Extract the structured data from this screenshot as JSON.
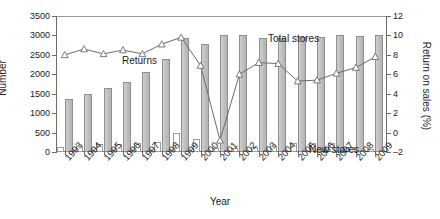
{
  "chart_data": {
    "type": "bar",
    "title": "",
    "xlabel": "Year",
    "ylabel": "Number",
    "ylabel_right": "Return on sales (%)",
    "categories": [
      "1993",
      "1994",
      "1995",
      "1996",
      "1997",
      "1998",
      "1999",
      "2000",
      "2001",
      "2002",
      "2003",
      "2004",
      "2005",
      "2006",
      "2007",
      "2008",
      "2009"
    ],
    "ylim": [
      0,
      3500
    ],
    "ylim_right": [
      -2,
      12
    ],
    "yticks": [
      0,
      500,
      1000,
      1500,
      2000,
      2500,
      3000,
      3500
    ],
    "yticks_right": [
      -2,
      0,
      2,
      4,
      6,
      8,
      10,
      12
    ],
    "grid": false,
    "legend_position": "in-plot annotations",
    "series": [
      {
        "name": "Total stores",
        "kind": "bar",
        "axis": "left",
        "color": "#c2c2c2",
        "values": [
          1360,
          1490,
          1640,
          1800,
          2060,
          2390,
          2930,
          2780,
          3010,
          3010,
          2930,
          2940,
          2960,
          2970,
          3000,
          2980,
          3010
        ]
      },
      {
        "name": "New stores",
        "kind": "bar",
        "axis": "left",
        "color": "#ffffff",
        "values": [
          130,
          160,
          200,
          195,
          240,
          270,
          490,
          340,
          110,
          105,
          120,
          150,
          230,
          230,
          235,
          120,
          90
        ]
      },
      {
        "name": "Returns",
        "kind": "line",
        "axis": "right",
        "color": "#6b6b6b",
        "marker": "triangle",
        "values": [
          8.0,
          8.6,
          8.1,
          8.5,
          8.1,
          9.1,
          9.8,
          6.9,
          -0.8,
          6.0,
          7.2,
          7.1,
          5.3,
          5.4,
          6.1,
          6.7,
          7.8
        ]
      }
    ],
    "annotations": [
      {
        "text": "Returns",
        "x": "1993-1994",
        "y": "upper-left"
      },
      {
        "text": "Total stores",
        "x": "2001-2002",
        "y": "top"
      },
      {
        "text": "New stores",
        "x": "2005-2006",
        "y": "bottom"
      }
    ],
    "caption": ""
  }
}
